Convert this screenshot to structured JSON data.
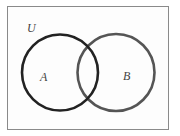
{
  "diagram": {
    "type": "venn",
    "universe": {
      "label": "U",
      "stroke": "#888888"
    },
    "sets": [
      {
        "label": "A",
        "stroke": "#222222"
      },
      {
        "label": "B",
        "stroke": "#555555"
      }
    ]
  }
}
